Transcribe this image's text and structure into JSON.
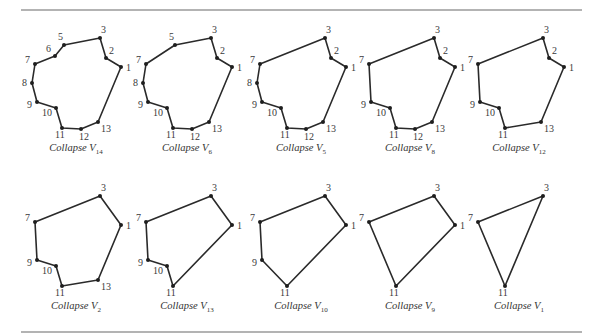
{
  "figure": {
    "rules": {
      "top_y": 10,
      "bottom_y": 332,
      "x1": 21,
      "x2": 582
    },
    "vertex_base": {
      "1": [
        121,
        67
      ],
      "2": [
        106,
        58
      ],
      "3": [
        100,
        38
      ],
      "5": [
        64,
        45
      ],
      "6": [
        55,
        56
      ],
      "7": [
        35,
        64
      ],
      "8": [
        32,
        83
      ],
      "9": [
        37,
        102
      ],
      "10": [
        56,
        108
      ],
      "11": [
        62,
        128
      ],
      "12": [
        81,
        129
      ],
      "13": [
        98,
        122
      ]
    },
    "label_offsets": {
      "1": [
        5,
        4
      ],
      "2": [
        3,
        -4
      ],
      "3": [
        1,
        -5
      ],
      "5": [
        -6,
        -5
      ],
      "6": [
        -9,
        -4
      ],
      "7": [
        -10,
        -1
      ],
      "8": [
        -10,
        3
      ],
      "9": [
        -10,
        6
      ],
      "10": [
        -14,
        8
      ],
      "11": [
        -7,
        10
      ],
      "12": [
        -2,
        11
      ],
      "13": [
        3,
        10
      ]
    },
    "row_offsets_y": [
      0,
      158
    ],
    "col_offsets_x": [
      0,
      111,
      225,
      334,
      443
    ],
    "panels": [
      {
        "row": 0,
        "col": 0,
        "caption_prefix": "Collapse V",
        "subscript": "14",
        "order": [
          "3",
          "2",
          "1",
          "13",
          "12",
          "11",
          "10",
          "9",
          "8",
          "7",
          "6",
          "5"
        ]
      },
      {
        "row": 0,
        "col": 1,
        "caption_prefix": "Collapse V",
        "subscript": "6",
        "order": [
          "3",
          "2",
          "1",
          "13",
          "12",
          "11",
          "10",
          "9",
          "8",
          "7",
          "5"
        ]
      },
      {
        "row": 0,
        "col": 2,
        "caption_prefix": "Collapse V",
        "subscript": "5",
        "order": [
          "3",
          "2",
          "1",
          "13",
          "12",
          "11",
          "10",
          "9",
          "8",
          "7"
        ]
      },
      {
        "row": 0,
        "col": 3,
        "caption_prefix": "Collapse V",
        "subscript": "8",
        "order": [
          "3",
          "2",
          "1",
          "13",
          "12",
          "11",
          "10",
          "9",
          "7"
        ]
      },
      {
        "row": 0,
        "col": 4,
        "caption_prefix": "Collapse V",
        "subscript": "12",
        "order": [
          "3",
          "2",
          "1",
          "13",
          "11",
          "10",
          "9",
          "7"
        ]
      },
      {
        "row": 1,
        "col": 0,
        "caption_prefix": "Collapse V",
        "subscript": "2",
        "order": [
          "3",
          "1",
          "13",
          "11",
          "10",
          "9",
          "7"
        ]
      },
      {
        "row": 1,
        "col": 1,
        "caption_prefix": "Collapse V",
        "subscript": "13",
        "order": [
          "3",
          "1",
          "11",
          "10",
          "9",
          "7"
        ]
      },
      {
        "row": 1,
        "col": 2,
        "caption_prefix": "Collapse V",
        "subscript": "10",
        "order": [
          "3",
          "1",
          "11",
          "9",
          "7"
        ]
      },
      {
        "row": 1,
        "col": 3,
        "caption_prefix": "Collapse V",
        "subscript": "9",
        "order": [
          "3",
          "1",
          "11",
          "7"
        ]
      },
      {
        "row": 1,
        "col": 4,
        "caption_prefix": "Collapse V",
        "subscript": "1",
        "order": [
          "3",
          "11",
          "7"
        ]
      }
    ],
    "caption_base": {
      "x": 76,
      "y": 151
    },
    "colors": {
      "edge": "#2a2a2a",
      "vertex": "#1e1e1e",
      "label": "#3a3a3a",
      "rule": "#9a9a9a"
    }
  }
}
